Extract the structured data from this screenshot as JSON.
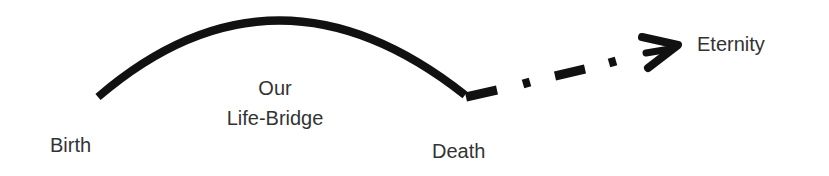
{
  "labels": {
    "birth": "Birth",
    "bridge_line1": "Our",
    "bridge_line2": "Life-Bridge",
    "death": "Death",
    "eternity": "Eternity"
  },
  "colors": {
    "stroke": "#111111",
    "text": "#333333"
  }
}
